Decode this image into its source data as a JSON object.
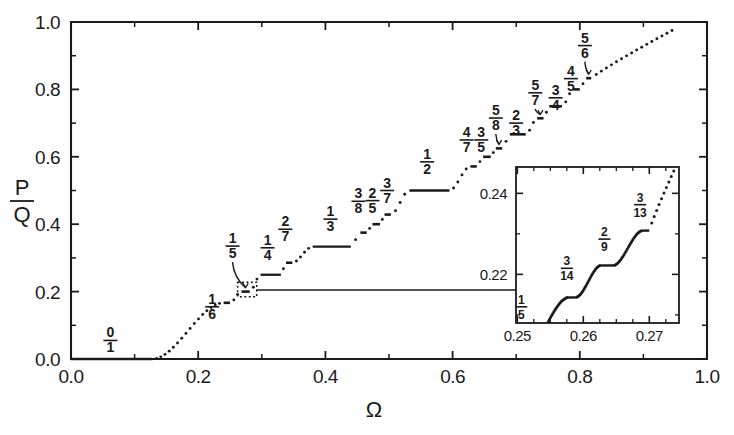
{
  "figure": {
    "title": "",
    "axis_x_label": "Ω",
    "axis_y_label_num": "P",
    "axis_y_label_den": "Q"
  },
  "chart_data": {
    "type": "line",
    "title": "",
    "subtitle": "",
    "xlabel": "Ω",
    "ylabel": "P/Q",
    "xlim": [
      0.0,
      1.0
    ],
    "ylim": [
      0.0,
      1.0
    ],
    "grid": false,
    "legend": null,
    "xticks": [
      0.0,
      0.2,
      0.4,
      0.6,
      0.8,
      1.0
    ],
    "xticklabels": [
      "0.0",
      "0.2",
      "0.4",
      "0.6",
      "0.8",
      "1.0"
    ],
    "yticks": [
      0.0,
      0.2,
      0.4,
      0.6,
      0.8,
      1.0
    ],
    "yticklabels": [
      "0.0",
      "0.2",
      "0.4",
      "0.6",
      "0.8",
      "1.0"
    ],
    "minor_xticks": [
      0.1,
      0.3,
      0.5,
      0.7,
      0.9
    ],
    "minor_yticks": [
      0.1,
      0.3,
      0.5,
      0.7,
      0.9
    ],
    "steps": [
      {
        "label_num": "0",
        "label_den": "1",
        "value": 0.0,
        "x_start": 0.0,
        "x_end": 0.128,
        "label_x": 0.062,
        "label_y": 0.055
      },
      {
        "label_num": "1",
        "label_den": "6",
        "value": 0.1667,
        "x_start": 0.24,
        "x_end": 0.25,
        "label_x": 0.222,
        "label_y": 0.155
      },
      {
        "label_num": "1",
        "label_den": "5",
        "value": 0.2,
        "x_start": 0.268,
        "x_end": 0.281,
        "label_x": 0.254,
        "label_y": 0.335
      },
      {
        "label_num": "1",
        "label_den": "4",
        "value": 0.25,
        "x_start": 0.298,
        "x_end": 0.33,
        "label_x": 0.309,
        "label_y": 0.33
      },
      {
        "label_num": "2",
        "label_den": "7",
        "value": 0.2857,
        "x_start": 0.338,
        "x_end": 0.348,
        "label_x": 0.337,
        "label_y": 0.385
      },
      {
        "label_num": "1",
        "label_den": "3",
        "value": 0.3333,
        "x_start": 0.38,
        "x_end": 0.44,
        "label_x": 0.408,
        "label_y": 0.415
      },
      {
        "label_num": "3",
        "label_den": "8",
        "value": 0.375,
        "x_start": 0.455,
        "x_end": 0.465,
        "label_x": 0.452,
        "label_y": 0.468
      },
      {
        "label_num": "2",
        "label_den": "5",
        "value": 0.4,
        "x_start": 0.474,
        "x_end": 0.486,
        "label_x": 0.474,
        "label_y": 0.47
      },
      {
        "label_num": "3",
        "label_den": "7",
        "value": 0.4286,
        "x_start": 0.493,
        "x_end": 0.503,
        "label_x": 0.497,
        "label_y": 0.5
      },
      {
        "label_num": "1",
        "label_den": "2",
        "value": 0.5,
        "x_start": 0.532,
        "x_end": 0.595,
        "label_x": 0.56,
        "label_y": 0.585
      },
      {
        "label_num": "4",
        "label_den": "7",
        "value": 0.5714,
        "x_start": 0.628,
        "x_end": 0.638,
        "label_x": 0.622,
        "label_y": 0.65
      },
      {
        "label_num": "3",
        "label_den": "5",
        "value": 0.6,
        "x_start": 0.648,
        "x_end": 0.66,
        "label_x": 0.645,
        "label_y": 0.65
      },
      {
        "label_num": "5",
        "label_den": "8",
        "value": 0.625,
        "x_start": 0.668,
        "x_end": 0.678,
        "label_x": 0.668,
        "label_y": 0.715
      },
      {
        "label_num": "2",
        "label_den": "3",
        "value": 0.6667,
        "x_start": 0.69,
        "x_end": 0.715,
        "label_x": 0.7,
        "label_y": 0.7
      },
      {
        "label_num": "5",
        "label_den": "7",
        "value": 0.7143,
        "x_start": 0.733,
        "x_end": 0.743,
        "label_x": 0.73,
        "label_y": 0.79
      },
      {
        "label_num": "3",
        "label_den": "4",
        "value": 0.75,
        "x_start": 0.752,
        "x_end": 0.772,
        "label_x": 0.762,
        "label_y": 0.775
      },
      {
        "label_num": "4",
        "label_den": "5",
        "value": 0.8,
        "x_start": 0.79,
        "x_end": 0.8,
        "label_x": 0.786,
        "label_y": 0.832
      },
      {
        "label_num": "5",
        "label_den": "6",
        "value": 0.8333,
        "x_start": 0.81,
        "x_end": 0.818,
        "label_x": 0.808,
        "label_y": 0.93
      }
    ],
    "inset": {
      "xlim": [
        0.2498,
        0.2745
      ],
      "ylim": [
        0.208,
        0.2465
      ],
      "xticks": [
        0.25,
        0.26,
        0.27
      ],
      "xticklabels": [
        "0.25",
        "0.26",
        "0.27"
      ],
      "yticks": [
        0.22,
        0.24
      ],
      "yticklabels": [
        "0.22",
        "0.24"
      ],
      "minor_xticks": [
        0.2525,
        0.255,
        0.2575,
        0.2625,
        0.265,
        0.2675,
        0.2725
      ],
      "minor_yticks": [
        0.21,
        0.23
      ],
      "steps": [
        {
          "label_num": "1",
          "label_den": "5",
          "value": 0.2,
          "x_start": 0.25,
          "x_end": 0.2508,
          "label_x": 0.2506,
          "label_y": 0.212
        },
        {
          "label_num": "3",
          "label_den": "14",
          "value": 0.2143,
          "x_start": 0.2578,
          "x_end": 0.2588,
          "label_x": 0.2575,
          "label_y": 0.2215
        },
        {
          "label_num": "2",
          "label_den": "9",
          "value": 0.2222,
          "x_start": 0.2627,
          "x_end": 0.2645,
          "label_x": 0.2632,
          "label_y": 0.2287
        },
        {
          "label_num": "3",
          "label_den": "13",
          "value": 0.2308,
          "x_start": 0.269,
          "x_end": 0.27,
          "label_x": 0.2686,
          "label_y": 0.2372
        }
      ]
    },
    "annotations": [
      {
        "name": "zoom-box",
        "type": "dotted-rect",
        "x_start": 0.262,
        "x_end": 0.292,
        "y_start": 0.185,
        "y_end": 0.228
      },
      {
        "name": "zoom-arrow",
        "type": "arrow",
        "from_x": 0.292,
        "from_y": 0.205,
        "to_x": 0.726,
        "to_y": 0.205
      }
    ]
  },
  "colors": {
    "ink": "#1a1a1a",
    "background": "#ffffff"
  }
}
